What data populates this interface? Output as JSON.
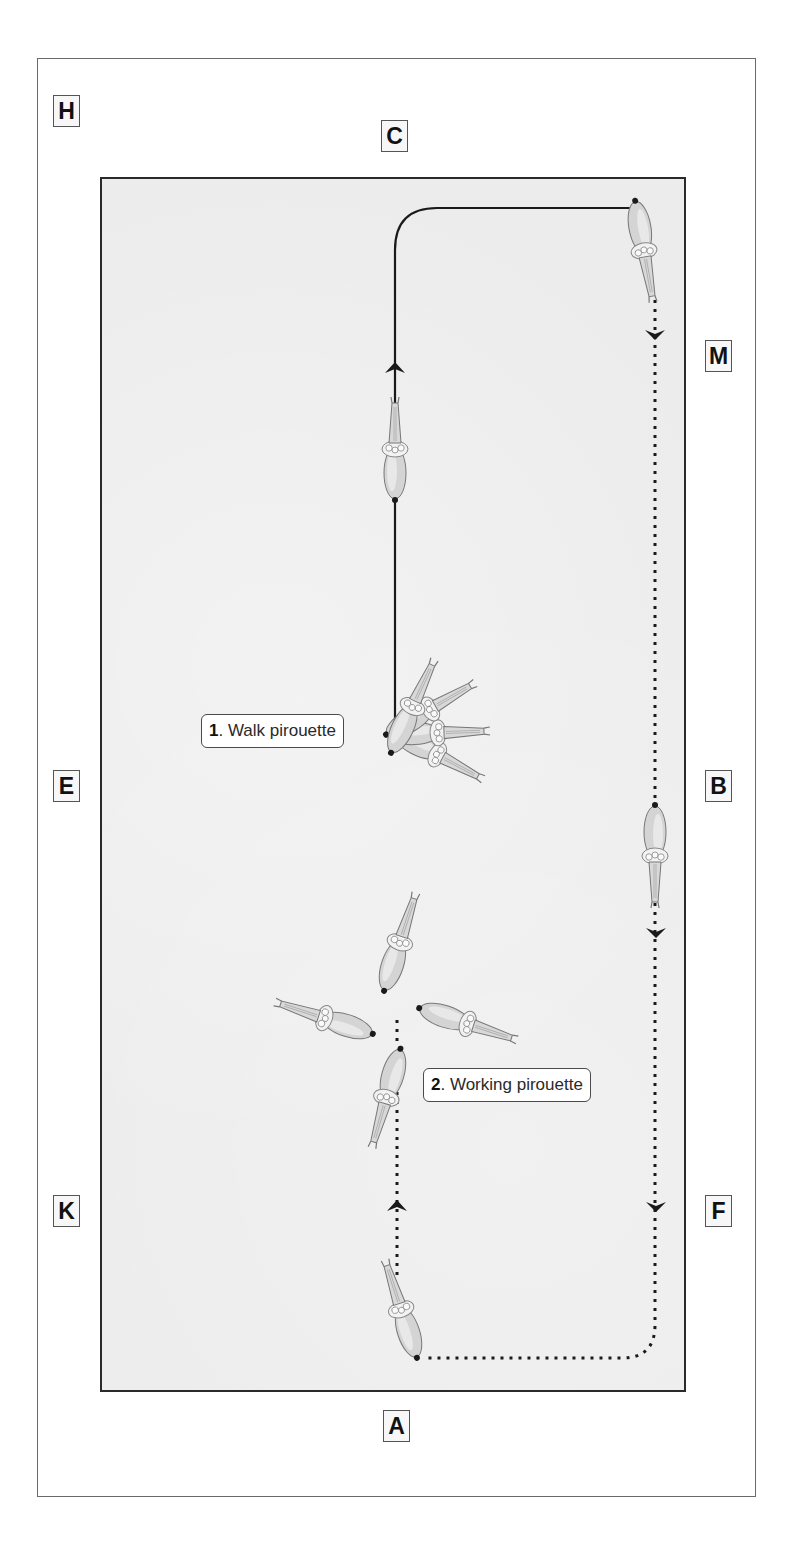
{
  "diagram": {
    "colors": {
      "arena_fill": "#ececec",
      "arena_border": "#2a2a2a",
      "path": "#1a1a1a",
      "frame": "#6a6a6a"
    },
    "markers": [
      {
        "letter": "C",
        "x": 381,
        "y": 120
      },
      {
        "letter": "H",
        "x": 53,
        "y": 95
      },
      {
        "letter": "M",
        "x": 705,
        "y": 340
      },
      {
        "letter": "E",
        "x": 53,
        "y": 770
      },
      {
        "letter": "B",
        "x": 705,
        "y": 770
      },
      {
        "letter": "K",
        "x": 53,
        "y": 1195
      },
      {
        "letter": "F",
        "x": 705,
        "y": 1195
      },
      {
        "letter": "A",
        "x": 383,
        "y": 1410
      }
    ],
    "labels": [
      {
        "number": "1",
        "text": ". Walk pirouette",
        "x": 201,
        "y": 714
      },
      {
        "number": "2",
        "text": ". Working pirouette",
        "x": 423,
        "y": 1068
      }
    ],
    "paths": {
      "walk_solid": "Solid line: up center line from pirouette point, turn right along C end, to M corner",
      "working_dotted": "Dotted line: down long side M–B–F, turn along A end, up center line to working pirouette"
    },
    "horses": [
      {
        "id": "top-right",
        "x": 643,
        "y": 245,
        "rot": 170
      },
      {
        "id": "centerline-up",
        "x": 395,
        "y": 455,
        "rot": 0
      },
      {
        "id": "long-side-B",
        "x": 655,
        "y": 850,
        "rot": 180
      },
      {
        "id": "working-north",
        "x": 398,
        "y": 945,
        "rot": 20
      },
      {
        "id": "working-west",
        "x": 335,
        "y": 1018,
        "rot": -70
      },
      {
        "id": "working-east",
        "x": 460,
        "y": 1020,
        "rot": 110
      },
      {
        "id": "working-south",
        "x": 388,
        "y": 1095,
        "rot": 195
      },
      {
        "id": "bottom-start",
        "x": 402,
        "y": 1310,
        "rot": -20
      }
    ],
    "walk_pirouette_fan": [
      {
        "x": 412,
        "y": 700,
        "rot": 25
      },
      {
        "x": 425,
        "y": 712,
        "rot": 60
      },
      {
        "x": 432,
        "y": 733,
        "rot": 85
      },
      {
        "x": 432,
        "y": 752,
        "rot": 115
      }
    ]
  }
}
